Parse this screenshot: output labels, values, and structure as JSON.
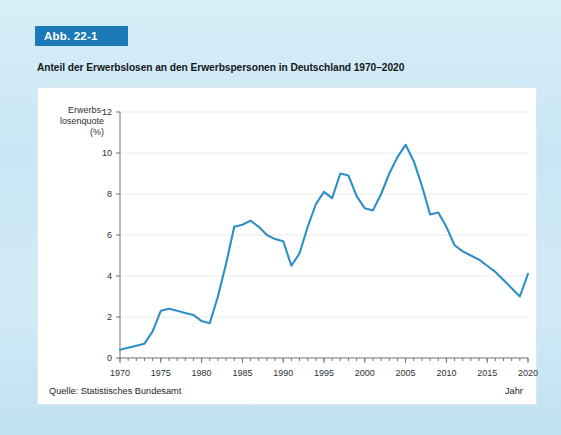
{
  "figure": {
    "badge_label": "Abb. 22-1",
    "title": "Anteil der Erwerbslosen an den Erwerbspersonen in Deutschland 1970–2020",
    "source": "Quelle: Statistisches Bundesamt",
    "x_axis_title": "Jahr",
    "colors": {
      "badge_background": "#1b79b8",
      "badge_text": "#ffffff",
      "page_background": "#cfe9f5",
      "card_background": "#ffffff",
      "line": "#2e8fc6",
      "gridline": "#e8eaec",
      "axis": "#6e7579",
      "text": "#14181c"
    }
  },
  "chart_data": {
    "type": "line",
    "title": "Anteil der Erwerbslosen an den Erwerbspersonen in Deutschland 1970–2020",
    "xlabel": "Jahr",
    "ylabel": "Erwerbs-\nlosenquote\n(%)",
    "ylabel_lines": [
      "Erwerbs-",
      "losenquote",
      "(%)"
    ],
    "xlim": [
      1970,
      2020
    ],
    "ylim": [
      0,
      12
    ],
    "yticks": [
      0,
      2,
      4,
      6,
      8,
      10,
      12
    ],
    "ytick_labels": [
      "0",
      "2",
      "4",
      "6",
      "8",
      "10",
      "12"
    ],
    "xticks": [
      1970,
      1975,
      1980,
      1985,
      1990,
      1995,
      2000,
      2005,
      2010,
      2015,
      2020
    ],
    "xtick_labels": [
      "1970",
      "1975",
      "1980",
      "1985",
      "1990",
      "1995",
      "2000",
      "2005",
      "2010",
      "2015",
      "2020"
    ],
    "x_minor_tick_step": 1,
    "grid": "horizontal",
    "legend": "none",
    "series": [
      {
        "name": "Erwerbslosenquote (%)",
        "color": "#2e8fc6",
        "x": [
          1970,
          1971,
          1972,
          1973,
          1974,
          1975,
          1976,
          1977,
          1978,
          1979,
          1980,
          1981,
          1982,
          1983,
          1984,
          1985,
          1986,
          1987,
          1988,
          1989,
          1990,
          1991,
          1992,
          1993,
          1994,
          1995,
          1996,
          1997,
          1998,
          1999,
          2000,
          2001,
          2002,
          2003,
          2004,
          2005,
          2006,
          2007,
          2008,
          2009,
          2010,
          2011,
          2012,
          2013,
          2014,
          2015,
          2016,
          2017,
          2018,
          2019,
          2020
        ],
        "values": [
          0.4,
          0.5,
          0.6,
          0.7,
          1.3,
          2.3,
          2.4,
          2.3,
          2.2,
          2.1,
          1.8,
          1.7,
          3.0,
          4.6,
          6.4,
          6.5,
          6.7,
          6.4,
          6.0,
          5.8,
          5.7,
          4.5,
          5.1,
          6.4,
          7.5,
          8.1,
          7.8,
          9.0,
          8.9,
          7.9,
          7.3,
          7.2,
          8.0,
          9.0,
          9.8,
          10.4,
          9.6,
          8.4,
          7.0,
          7.1,
          6.4,
          5.5,
          5.2,
          5.0,
          4.8,
          4.5,
          4.2,
          3.8,
          3.4,
          3.0,
          4.1
        ]
      }
    ]
  }
}
